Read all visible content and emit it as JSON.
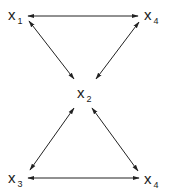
{
  "diagram": {
    "type": "graph",
    "nodes": [
      {
        "id": "n1",
        "var": "x",
        "sub": "1"
      },
      {
        "id": "n4top",
        "var": "x",
        "sub": "4"
      },
      {
        "id": "n2",
        "var": "x",
        "sub": "2"
      },
      {
        "id": "n3",
        "var": "x",
        "sub": "3"
      },
      {
        "id": "n4bottom",
        "var": "x",
        "sub": "4"
      }
    ],
    "edges": [
      {
        "from": "n1",
        "to": "n4top",
        "direction": "both"
      },
      {
        "from": "n1",
        "to": "n2",
        "direction": "both"
      },
      {
        "from": "n4top",
        "to": "n2",
        "direction": "both"
      },
      {
        "from": "n2",
        "to": "n3",
        "direction": "both"
      },
      {
        "from": "n2",
        "to": "n4bottom",
        "direction": "both"
      },
      {
        "from": "n3",
        "to": "n4bottom",
        "direction": "both"
      }
    ],
    "line_color": "#222222"
  }
}
